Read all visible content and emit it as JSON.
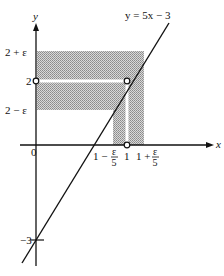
{
  "diagram": {
    "title": "y = 5x − 3",
    "axes": {
      "x_label": "x",
      "y_label": "y",
      "origin_label": "0"
    },
    "y_ticks": [
      {
        "label": "2 + ε",
        "value": "2+eps"
      },
      {
        "label": "2",
        "value": 2
      },
      {
        "label": "2 − ε",
        "value": "2-eps"
      },
      {
        "label": "−3",
        "value": -3
      }
    ],
    "x_ticks": [
      {
        "label_main": "1 −",
        "label_num": "ε",
        "label_den": "5",
        "value": "1-eps/5"
      },
      {
        "label_main": "1",
        "value": 1
      },
      {
        "label_main": "1 +",
        "label_num": "ε",
        "label_den": "5",
        "value": "1+eps/5"
      }
    ],
    "line": {
      "equation": "y = 5x − 3",
      "slope": 5,
      "intercept": -3
    },
    "open_points": [
      {
        "name": "point-1-2",
        "x": 1,
        "y": 2
      },
      {
        "name": "point-on-y-axis",
        "x": 0,
        "y": 2
      },
      {
        "name": "point-on-x-axis",
        "x": 1,
        "y": 0
      }
    ],
    "shaded_regions": [
      {
        "name": "horizontal-band",
        "range": "2-ε < y < 2+ε"
      },
      {
        "name": "vertical-band",
        "range": "1-ε/5 < x < 1+ε/5"
      }
    ],
    "colors": {
      "ink": "#111111",
      "shade": "#b8b8b8",
      "background": "#ffffff"
    }
  }
}
